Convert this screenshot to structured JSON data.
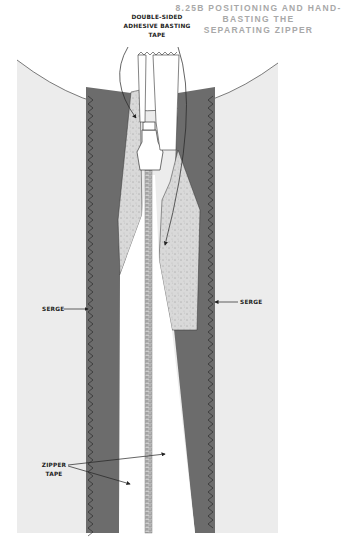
{
  "figure": {
    "number": "8.25B",
    "title_lines": [
      "8.25B  POSITIONING AND HAND-",
      "BASTING THE",
      "SEPARATING ZIPPER"
    ]
  },
  "labels": {
    "adhesive_tape": [
      "DOUBLE-SIDED",
      "ADHESIVE BASTING",
      "TAPE"
    ],
    "serge_left": "SERGE",
    "serge_right": "SERGE",
    "zipper_tape": [
      "ZIPPER",
      "TAPE"
    ]
  },
  "colors": {
    "garment": "#ececec",
    "panel": "#6c6c6c",
    "tape": "#d6d6d6",
    "zipper": "#ffffff",
    "title": "#a8a8a8",
    "ink": "#222222"
  }
}
